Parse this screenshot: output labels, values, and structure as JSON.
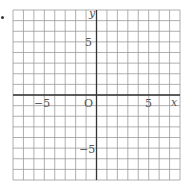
{
  "chart_data": {
    "type": "scatter",
    "title": "",
    "xlabel": "x",
    "ylabel": "y",
    "xlim": [
      -8,
      8
    ],
    "ylim": [
      -8,
      8
    ],
    "grid": true,
    "grid_step": 1,
    "x_ticks_labeled": [
      -5,
      5
    ],
    "y_ticks_labeled": [
      5,
      -5
    ],
    "origin_label": "O",
    "series": []
  },
  "labels": {
    "x_axis": "x",
    "y_axis": "y",
    "origin": "O",
    "x_neg5": "−5",
    "x_pos5": "5",
    "y_pos5": "5",
    "y_neg5": "−5"
  },
  "colors": {
    "grid": "#9a9a9a",
    "axis": "#333333",
    "text": "#555555"
  }
}
